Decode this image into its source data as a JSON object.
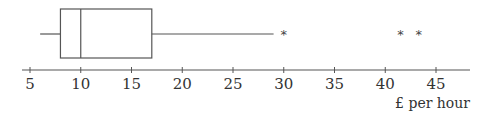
{
  "chart_data": {
    "type": "boxplot",
    "title": "",
    "xlabel": "£ per hour",
    "ylabel": "",
    "xlim": [
      3,
      48
    ],
    "ticks": [
      5,
      10,
      15,
      20,
      25,
      30,
      35,
      40,
      45
    ],
    "tick_labels": [
      "5",
      "10",
      "15",
      "20",
      "25",
      "30",
      "35",
      "40",
      "45"
    ],
    "grid": false,
    "legend": null,
    "box": {
      "whisker_low": 6,
      "q1": 8,
      "median": 10,
      "q3": 17,
      "whisker_high": 29
    },
    "outliers": [
      30,
      41.5,
      43.3
    ],
    "outlier_marker": "*"
  },
  "style": {
    "line_color": "#555555",
    "text_color": "#333333"
  }
}
